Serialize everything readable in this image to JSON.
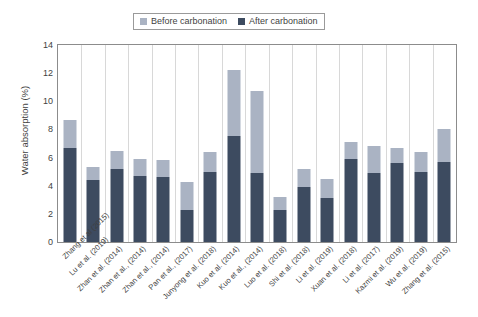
{
  "chart_data": {
    "type": "bar",
    "subtype": "stacked-bar",
    "title": "",
    "xlabel": "",
    "ylabel": "Water absorption (%)",
    "ylim": [
      0,
      14
    ],
    "yticks": [
      0,
      2,
      4,
      6,
      8,
      10,
      12,
      14
    ],
    "grid": "vertical-only",
    "legend_position": "top-center",
    "legend": [
      "Before carbonation",
      "After carbonation"
    ],
    "categories": [
      "Zhang et al (2015)",
      "Lu et al. (2019)",
      "Zhan et al. (2014)",
      "Zhan et al., (2014)",
      "Zhan et al., (2014)",
      "Pan et al., (2017)",
      "Junyong et al. (2018)",
      "Kuo et al. (2014)",
      "Kuo et al., (2014)",
      "Luo et al. (2018)",
      "Shi et al. (2018)",
      "Li et al. (2019)",
      "Xuan et al. (2018)",
      "Li et al. (2017)",
      "Kazmi et al. (2019)",
      "Wu et al. (2019)",
      "Zhang et al. (2015)"
    ],
    "series": [
      {
        "name": "After carbonation",
        "color": "#3d4b60",
        "values": [
          6.7,
          4.4,
          5.2,
          4.7,
          4.6,
          2.3,
          5.0,
          7.5,
          4.9,
          2.3,
          3.9,
          3.1,
          5.9,
          4.9,
          5.6,
          5.0,
          5.7
        ]
      },
      {
        "name": "Before carbonation",
        "color": "#aab3c3",
        "values": [
          8.7,
          5.3,
          6.5,
          5.9,
          5.8,
          4.3,
          6.4,
          12.2,
          10.7,
          3.2,
          5.2,
          4.5,
          7.1,
          6.8,
          6.7,
          6.4,
          8.0
        ],
        "note": "total bar height (before carbonation); light segment spans from after-value to this total"
      }
    ]
  }
}
